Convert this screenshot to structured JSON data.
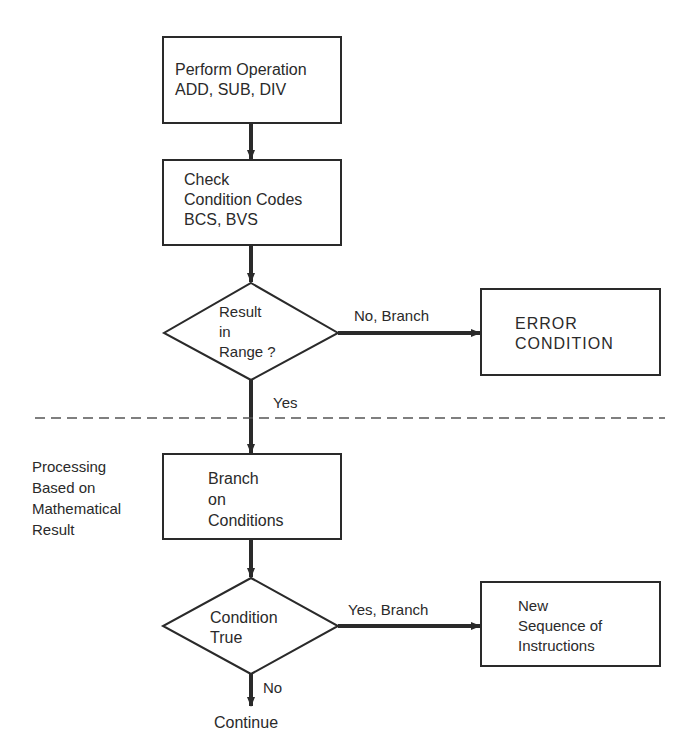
{
  "diagram": {
    "type": "flowchart",
    "nodes": {
      "perform_operation": {
        "shape": "process",
        "lines": [
          "Perform Operation",
          "ADD, SUB, DIV"
        ]
      },
      "check_condition_codes": {
        "shape": "process",
        "lines": [
          "Check",
          "Condition Codes",
          "BCS, BVS"
        ]
      },
      "result_in_range": {
        "shape": "decision",
        "lines": [
          "Result",
          "in",
          "Range ?"
        ]
      },
      "error_condition": {
        "shape": "process",
        "lines": [
          "ERROR",
          "CONDITION"
        ]
      },
      "branch_on_conditions": {
        "shape": "process",
        "lines": [
          "Branch",
          "on",
          "Conditions"
        ]
      },
      "condition_true": {
        "shape": "decision",
        "lines": [
          "Condition",
          "True"
        ]
      },
      "new_sequence": {
        "shape": "process",
        "lines": [
          "New",
          "Sequence of",
          "Instructions"
        ]
      },
      "continue": {
        "shape": "terminal-text",
        "label": "Continue"
      }
    },
    "edges": {
      "no_branch": "No, Branch",
      "yes_1": "Yes",
      "yes_branch": "Yes, Branch",
      "no_2": "No"
    },
    "side_note": {
      "lines": [
        "Processing",
        "Based on",
        "Mathematical",
        "Result"
      ]
    }
  }
}
